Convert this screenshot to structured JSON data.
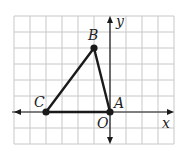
{
  "diagram": {
    "type": "coordinate-grid-triangle",
    "grid": {
      "x_min": -6,
      "x_max": 4,
      "y_min": -2,
      "y_max": 6,
      "cell_px": 16,
      "origin_px": [
        110,
        112
      ],
      "grid_color": "#c8c8c8",
      "line_color": "#1a1a1a"
    },
    "axes": {
      "x_label": "x",
      "y_label": "y",
      "origin_label": "O"
    },
    "points": [
      {
        "name": "A",
        "x": 0,
        "y": 0
      },
      {
        "name": "B",
        "x": -1,
        "y": 4
      },
      {
        "name": "C",
        "x": -4,
        "y": 0
      }
    ],
    "segments": [
      [
        "A",
        "B"
      ],
      [
        "B",
        "C"
      ],
      [
        "C",
        "A"
      ]
    ]
  }
}
